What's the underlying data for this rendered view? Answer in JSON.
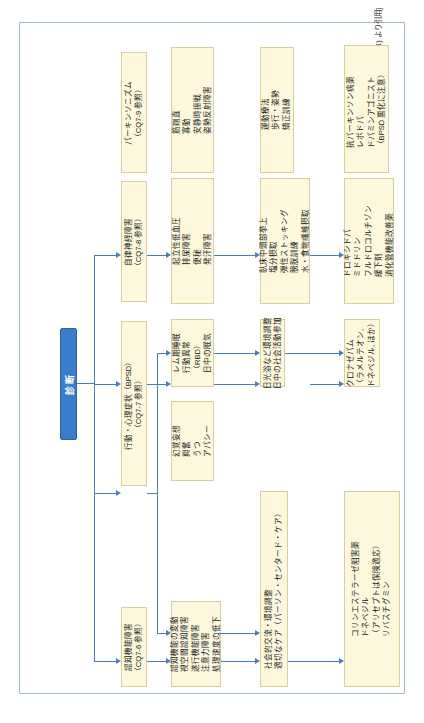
{
  "figure": {
    "title": "図3.3.2　レビー小体型認知症の治療方針のアルゴリズム",
    "source_credit": "[文献 1) より引用]",
    "accent_color": "#3a7dc9",
    "box_fill": "#fcf7dd",
    "box_border": "#d8cf9a",
    "panel_border": "#9dbbd6"
  },
  "diagnosis": {
    "label": "診断"
  },
  "rows": [
    {
      "id": "cognitive",
      "symptom": {
        "lines": [
          "認知機能障害",
          "（CQ7-6 参照）"
        ]
      },
      "features": {
        "lines": [
          "認知機能の変動",
          "視空間認知障害",
          "遂行機能障害",
          "注意力障害",
          "処理速度の低下"
        ]
      },
      "nondrug": {
        "lines": [
          "社会的交流・環境調整",
          "適切なケア（パーソン・センタード・ケア）"
        ]
      },
      "drug": {
        "lines": [
          "コリンエステラーゼ阻害薬",
          "ドネペジル",
          "（アリセプトは保険適応）",
          "リバスチグミン"
        ]
      }
    },
    {
      "id": "bpsd",
      "symptom": {
        "lines": [
          "行動・心理症状（BPSD）",
          "（CQ7-7 参照）"
        ]
      },
      "branches": [
        {
          "features": {
            "lines": [
              "レム期睡眠",
              "行動異常",
              "（RBD）",
              "日中の眠気"
            ]
          },
          "nondrug": {
            "lines": [
              "日光浴など環境調整",
              "日中の社会活動参加"
            ]
          },
          "drug": {
            "lines": [
              "クロナゼパム",
              "（ラメルテオン,",
              "ドネペジル, ほか）"
            ]
          }
        },
        {
          "features": {
            "lines": [
              "幻覚妄想",
              "興奮",
              "うつ",
              "アパシー"
            ]
          },
          "nondrug": {
            "lines": [
              "社会的交流・環境調整・認知行動療法",
              "適切なケア（パーソン・センタード・ケア）"
            ]
          },
          "drug": {
            "lines": [
              "コリンエステラーゼ阻害薬",
              "NMDA 受容体拮抗薬",
              "メマンチン",
              "抗うつ薬（抑うつには注意）",
              "非定型抗精神病薬（過敏性に注意）",
              "SSRI/SNRI"
            ]
          }
        }
      ]
    },
    {
      "id": "autonomic",
      "symptom": {
        "lines": [
          "自律神経障害",
          "（CQ7-8 参照）"
        ]
      },
      "features": {
        "lines": [
          "起立性低血圧",
          "排尿障害",
          "便秘",
          "発汗障害"
        ]
      },
      "nondrug": {
        "lines": [
          "臥床中頭部挙上",
          "塩分摂取",
          "弾性ストッキング",
          "膀胱訓練",
          "水・食物繊維摂取"
        ]
      },
      "drug": {
        "lines": [
          "ドロキシドパ",
          "ミドドリン",
          "フルドロコルチゾン",
          "緩下剤",
          "消化管機能改善薬"
        ]
      }
    },
    {
      "id": "parkinsonism",
      "symptom": {
        "lines": [
          "パーキンソニズム",
          "（CQ7-9 参照）"
        ]
      },
      "features": {
        "lines": [
          "筋剛直",
          "寡動",
          "安静時振戦",
          "姿勢反射障害"
        ]
      },
      "nondrug": {
        "lines": [
          "運動療法",
          "歩行・姿勢",
          "矯正訓練"
        ]
      },
      "drug": {
        "lines": [
          "抗パーキンソン病薬",
          "レボドパ",
          "ドパミンアゴニスト",
          "（BPSD 悪化に注意）"
        ]
      }
    }
  ]
}
